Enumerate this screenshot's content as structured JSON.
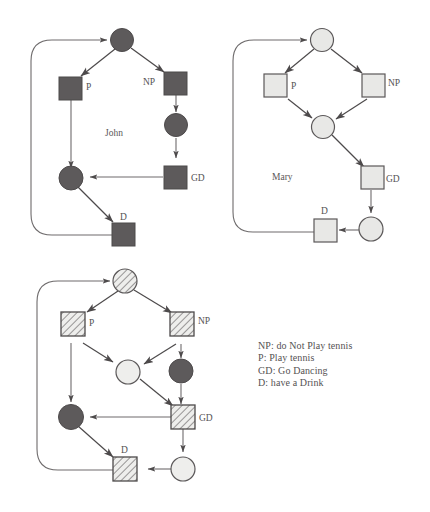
{
  "figure": {
    "type": "petri-net-diagrams",
    "diagram_count": 3
  },
  "diagrams": [
    {
      "id": "john",
      "name_label": "John",
      "fill_style": "solid-dark",
      "node_labels": {
        "p": "P",
        "np": "NP",
        "gd": "GD",
        "d": "D"
      }
    },
    {
      "id": "mary",
      "name_label": "Mary",
      "fill_style": "light-outline",
      "node_labels": {
        "p": "P",
        "np": "NP",
        "gd": "GD",
        "d": "D"
      }
    },
    {
      "id": "combined",
      "name_label": "",
      "fill_style": "hatched",
      "node_labels": {
        "p": "P",
        "np": "NP",
        "gd": "GD",
        "d": "D"
      }
    }
  ],
  "legend": {
    "lines": [
      "NP: do Not Play tennis",
      "P: Play tennis",
      "GD: Go Dancing",
      "D: have a Drink"
    ]
  },
  "colors": {
    "dark_fill": "#5d5a5b",
    "light_fill": "#e6e6e4",
    "stroke": "#4d4a4b",
    "text": "#555253",
    "background": "#ffffff"
  }
}
